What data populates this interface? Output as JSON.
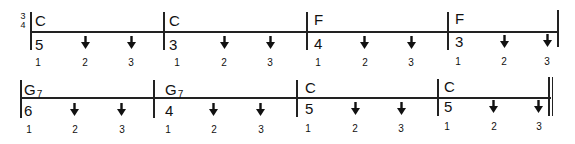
{
  "time_signature": {
    "top": "3",
    "bottom": "4"
  },
  "rows": [
    {
      "measures": [
        {
          "chord": "C",
          "chord_sub": "",
          "number": "5",
          "beats": [
            "1",
            "2",
            "3"
          ],
          "strums": [
            "",
            "down",
            "down"
          ]
        },
        {
          "chord": "C",
          "chord_sub": "",
          "number": "3",
          "beats": [
            "1",
            "2",
            "3"
          ],
          "strums": [
            "",
            "down",
            "down"
          ]
        },
        {
          "chord": "F",
          "chord_sub": "",
          "number": "4",
          "beats": [
            "1",
            "2",
            "3"
          ],
          "strums": [
            "",
            "down",
            "down"
          ]
        },
        {
          "chord": "F",
          "chord_sub": "",
          "number": "3",
          "beats": [
            "1",
            "2",
            "3"
          ],
          "strums": [
            "",
            "down",
            "down"
          ]
        }
      ],
      "end_barline": "single"
    },
    {
      "measures": [
        {
          "chord": "G",
          "chord_sub": "7",
          "number": "6",
          "beats": [
            "1",
            "2",
            "3"
          ],
          "strums": [
            "",
            "down",
            "down"
          ]
        },
        {
          "chord": "G",
          "chord_sub": "7",
          "number": "4",
          "beats": [
            "1",
            "2",
            "3"
          ],
          "strums": [
            "",
            "down",
            "down"
          ]
        },
        {
          "chord": "C",
          "chord_sub": "",
          "number": "5",
          "beats": [
            "1",
            "2",
            "3"
          ],
          "strums": [
            "",
            "down",
            "down"
          ]
        },
        {
          "chord": "C",
          "chord_sub": "",
          "number": "5",
          "beats": [
            "1",
            "2",
            "3"
          ],
          "strums": [
            "",
            "down",
            "down"
          ]
        }
      ],
      "end_barline": "double"
    }
  ],
  "icons": {
    "strum": "down-arrow-icon"
  }
}
